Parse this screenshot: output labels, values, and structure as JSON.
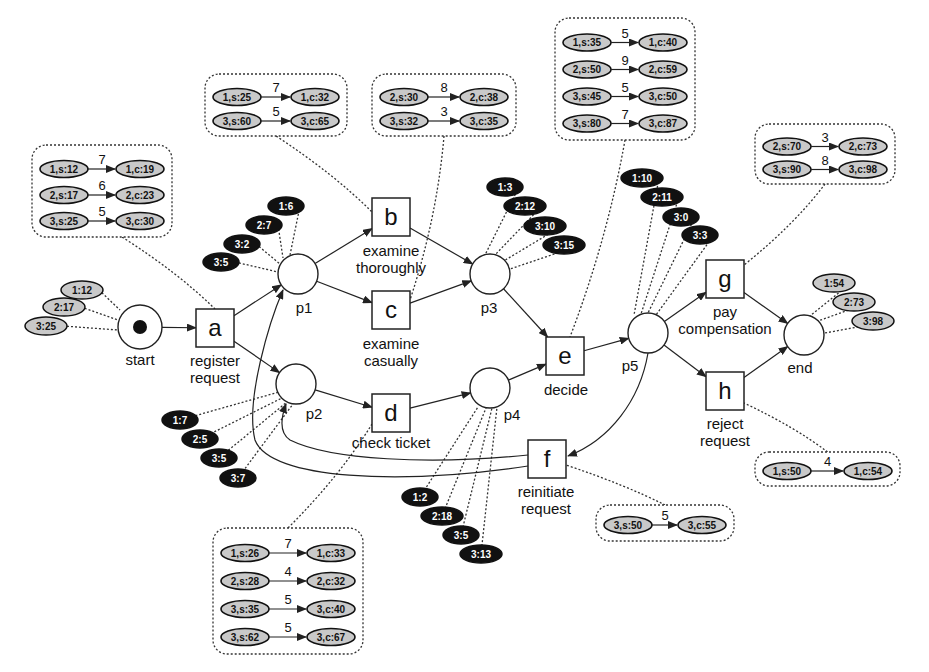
{
  "diagram": {
    "type": "petri-net",
    "places": [
      {
        "id": "start",
        "label": "start",
        "cx": 140,
        "cy": 327,
        "token": true,
        "lx": 140,
        "ly": 365
      },
      {
        "id": "p1",
        "label": "p1",
        "cx": 298,
        "cy": 274,
        "token": false,
        "lx": 304,
        "ly": 313
      },
      {
        "id": "p2",
        "label": "p2",
        "cx": 296,
        "cy": 384,
        "token": false,
        "lx": 314,
        "ly": 419
      },
      {
        "id": "p3",
        "label": "p3",
        "cx": 490,
        "cy": 274,
        "token": false,
        "lx": 489,
        "ly": 313
      },
      {
        "id": "p4",
        "label": "p4",
        "cx": 490,
        "cy": 388,
        "token": false,
        "lx": 512,
        "ly": 420
      },
      {
        "id": "p5",
        "label": "p5",
        "cx": 648,
        "cy": 333,
        "token": false,
        "lx": 630,
        "ly": 371
      },
      {
        "id": "end",
        "label": "end",
        "cx": 804,
        "cy": 335,
        "token": false,
        "lx": 800,
        "ly": 373
      }
    ],
    "transitions": [
      {
        "id": "a",
        "letter": "a",
        "x": 196,
        "y": 309,
        "labels": [
          "register",
          "request"
        ],
        "lx": 215,
        "ly": 366
      },
      {
        "id": "b",
        "letter": "b",
        "x": 372,
        "y": 198,
        "labels": [
          "examine",
          "thoroughly"
        ],
        "lx": 391,
        "ly": 256
      },
      {
        "id": "c",
        "letter": "c",
        "x": 372,
        "y": 291,
        "labels": [
          "examine",
          "casually"
        ],
        "lx": 391,
        "ly": 349
      },
      {
        "id": "d",
        "letter": "d",
        "x": 372,
        "y": 394,
        "labels": [
          "check ticket"
        ],
        "lx": 391,
        "ly": 448
      },
      {
        "id": "e",
        "letter": "e",
        "x": 546,
        "y": 337,
        "labels": [
          "decide"
        ],
        "lx": 566,
        "ly": 395
      },
      {
        "id": "f",
        "letter": "f",
        "x": 528,
        "y": 440,
        "labels": [
          "reinitiate",
          "request"
        ],
        "lx": 546,
        "ly": 497
      },
      {
        "id": "g",
        "letter": "g",
        "x": 706,
        "y": 260,
        "labels": [
          "pay",
          "compensation"
        ],
        "lx": 725,
        "ly": 317
      },
      {
        "id": "h",
        "letter": "h",
        "x": 706,
        "y": 372,
        "labels": [
          "reject",
          "request"
        ],
        "lx": 725,
        "ly": 429
      }
    ],
    "place_tokens": {
      "start": {
        "style": "light",
        "items": [
          {
            "text": "1:12",
            "x": 82,
            "y": 290,
            "lx": 120,
            "ly": 310
          },
          {
            "text": "2:17",
            "x": 64,
            "y": 307,
            "lx": 118,
            "ly": 320
          },
          {
            "text": "3:25",
            "x": 46,
            "y": 326,
            "lx": 118,
            "ly": 330
          }
        ]
      },
      "p1": {
        "style": "dark",
        "items": [
          {
            "text": "1:6",
            "x": 286,
            "y": 206,
            "lx": 290,
            "ly": 255
          },
          {
            "text": "2:7",
            "x": 264,
            "y": 225,
            "lx": 283,
            "ly": 258
          },
          {
            "text": "3:2",
            "x": 242,
            "y": 244,
            "lx": 280,
            "ly": 264
          },
          {
            "text": "3:5",
            "x": 221,
            "y": 262,
            "lx": 278,
            "ly": 272
          }
        ]
      },
      "p3": {
        "style": "dark",
        "items": [
          {
            "text": "1:3",
            "x": 505,
            "y": 187,
            "lx": 485,
            "ly": 255
          },
          {
            "text": "2:12",
            "x": 525,
            "y": 206,
            "lx": 493,
            "ly": 257
          },
          {
            "text": "3:10",
            "x": 545,
            "y": 226,
            "lx": 502,
            "ly": 262
          },
          {
            "text": "3:15",
            "x": 564,
            "y": 245,
            "lx": 510,
            "ly": 269
          }
        ]
      },
      "p5": {
        "style": "dark",
        "items": [
          {
            "text": "1:10",
            "x": 642,
            "y": 178,
            "lx": 634,
            "ly": 315
          },
          {
            "text": "2:11",
            "x": 662,
            "y": 197,
            "lx": 641,
            "ly": 314
          },
          {
            "text": "3:0",
            "x": 681,
            "y": 217,
            "lx": 648,
            "ly": 313
          },
          {
            "text": "3:3",
            "x": 700,
            "y": 235,
            "lx": 656,
            "ly": 315
          }
        ]
      },
      "end": {
        "style": "light",
        "items": [
          {
            "text": "1:54",
            "x": 834,
            "y": 283,
            "lx": 810,
            "ly": 316
          },
          {
            "text": "2:73",
            "x": 854,
            "y": 302,
            "lx": 818,
            "ly": 321
          },
          {
            "text": "3:98",
            "x": 873,
            "y": 321,
            "lx": 825,
            "ly": 333
          }
        ]
      },
      "p2": {
        "style": "dark",
        "items": [
          {
            "text": "1:7",
            "x": 180,
            "y": 420,
            "lx": 279,
            "ly": 392
          },
          {
            "text": "2:5",
            "x": 200,
            "y": 439,
            "lx": 282,
            "ly": 398
          },
          {
            "text": "3:5",
            "x": 219,
            "y": 458,
            "lx": 287,
            "ly": 402
          },
          {
            "text": "3:7",
            "x": 238,
            "y": 478,
            "lx": 293,
            "ly": 404
          }
        ]
      },
      "p4": {
        "style": "dark",
        "items": [
          {
            "text": "1:2",
            "x": 420,
            "y": 497,
            "lx": 478,
            "ly": 407
          },
          {
            "text": "2:18",
            "x": 442,
            "y": 516,
            "lx": 486,
            "ly": 408
          },
          {
            "text": "3:5",
            "x": 461,
            "y": 535,
            "lx": 492,
            "ly": 408
          },
          {
            "text": "3:13",
            "x": 481,
            "y": 554,
            "lx": 497,
            "ly": 407
          }
        ]
      }
    },
    "event_boxes": [
      {
        "for": "a",
        "x": 32,
        "y": 145,
        "w": 140,
        "h": 92,
        "lx": 215,
        "ly": 309,
        "rows": [
          {
            "start": "1,s:12",
            "duration": "7",
            "complete": "1,c:19"
          },
          {
            "start": "2,s:17",
            "duration": "6",
            "complete": "2,c:23"
          },
          {
            "start": "3,s:25",
            "duration": "5",
            "complete": "3,c:30"
          }
        ]
      },
      {
        "for": "b",
        "x": 205,
        "y": 74,
        "w": 142,
        "h": 62,
        "lx": 372,
        "ly": 212,
        "rows": [
          {
            "start": "1,s:25",
            "duration": "7",
            "complete": "1,c:32"
          },
          {
            "start": "3,s:60",
            "duration": "5",
            "complete": "3,c:65"
          }
        ]
      },
      {
        "for": "c",
        "x": 372,
        "y": 74,
        "w": 144,
        "h": 62,
        "lx": 410,
        "ly": 300,
        "rows": [
          {
            "start": "2,s:30",
            "duration": "8",
            "complete": "2,c:38"
          },
          {
            "start": "3,s:32",
            "duration": "3",
            "complete": "3,c:35"
          }
        ]
      },
      {
        "for": "e",
        "x": 555,
        "y": 18,
        "w": 140,
        "h": 122,
        "lx": 570,
        "ly": 337,
        "rows": [
          {
            "start": "1,s:35",
            "duration": "5",
            "complete": "1,c:40"
          },
          {
            "start": "2,s:50",
            "duration": "9",
            "complete": "2,c:59"
          },
          {
            "start": "3,s:45",
            "duration": "5",
            "complete": "3,c:50"
          },
          {
            "start": "3,s:80",
            "duration": "7",
            "complete": "3,c:87"
          }
        ]
      },
      {
        "for": "g",
        "x": 755,
        "y": 124,
        "w": 140,
        "h": 60,
        "lx": 744,
        "ly": 265,
        "rows": [
          {
            "start": "2,s:70",
            "duration": "3",
            "complete": "2,c:73"
          },
          {
            "start": "3,s:90",
            "duration": "8",
            "complete": "3,c:98"
          }
        ]
      },
      {
        "for": "h",
        "x": 755,
        "y": 452,
        "w": 145,
        "h": 34,
        "lx": 744,
        "ly": 403,
        "rows": [
          {
            "start": "1,s:50",
            "duration": "4",
            "complete": "1,c:54"
          }
        ]
      },
      {
        "for": "f",
        "x": 596,
        "y": 505,
        "w": 138,
        "h": 36,
        "lx": 566,
        "ly": 465,
        "rows": [
          {
            "start": "3,s:50",
            "duration": "5",
            "complete": "3,c:55"
          }
        ]
      },
      {
        "for": "d",
        "x": 213,
        "y": 528,
        "w": 150,
        "h": 126,
        "lx": 372,
        "ly": 424,
        "rows": [
          {
            "start": "1,s:26",
            "duration": "7",
            "complete": "1,c:33"
          },
          {
            "start": "2,s:28",
            "duration": "4",
            "complete": "2,c:32"
          },
          {
            "start": "3,s:35",
            "duration": "5",
            "complete": "3,c:40"
          },
          {
            "start": "3,s:62",
            "duration": "5",
            "complete": "3,c:67"
          }
        ]
      }
    ],
    "arcs": [
      [
        "start",
        "a"
      ],
      [
        "a",
        "p1"
      ],
      [
        "a",
        "p2"
      ],
      [
        "p1",
        "b"
      ],
      [
        "p1",
        "c"
      ],
      [
        "p2",
        "d"
      ],
      [
        "b",
        "p3"
      ],
      [
        "c",
        "p3"
      ],
      [
        "d",
        "p4"
      ],
      [
        "p3",
        "e"
      ],
      [
        "p4",
        "e"
      ],
      [
        "e",
        "p5"
      ],
      [
        "p5",
        "g"
      ],
      [
        "p5",
        "h"
      ],
      [
        "p5",
        "f"
      ],
      [
        "g",
        "end"
      ],
      [
        "h",
        "end"
      ],
      [
        "f",
        "p1"
      ],
      [
        "f",
        "p2"
      ]
    ],
    "colors": {
      "stroke": "#222222",
      "light_token_fill": "#c9c9c9",
      "dark_token_fill": "#111111",
      "dark_token_text": "#ffffff",
      "background": "#ffffff"
    }
  }
}
